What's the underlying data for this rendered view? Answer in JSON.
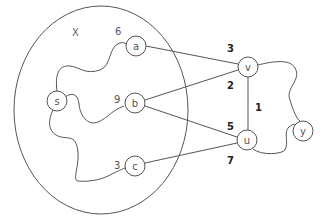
{
  "diagram": {
    "set": {
      "label": "X"
    },
    "nodes": {
      "s": {
        "label": "s"
      },
      "a": {
        "label": "a"
      },
      "b": {
        "label": "b"
      },
      "c": {
        "label": "c"
      },
      "v": {
        "label": "v"
      },
      "u": {
        "label": "u"
      },
      "y": {
        "label": "y"
      }
    },
    "edges": {
      "s_a": {
        "weight": "6",
        "style": "path"
      },
      "s_b": {
        "weight": "9",
        "style": "path"
      },
      "s_c": {
        "weight": "3",
        "style": "path"
      },
      "a_v": {
        "weight": "3"
      },
      "b_v": {
        "weight": "2"
      },
      "b_u": {
        "weight": "5"
      },
      "c_u": {
        "weight": "7"
      },
      "v_u": {
        "weight": "1"
      },
      "v_y": {
        "style": "path"
      },
      "u_y": {
        "style": "path"
      }
    },
    "colors": {
      "stroke": "#555555",
      "background": "#ffffff"
    }
  }
}
